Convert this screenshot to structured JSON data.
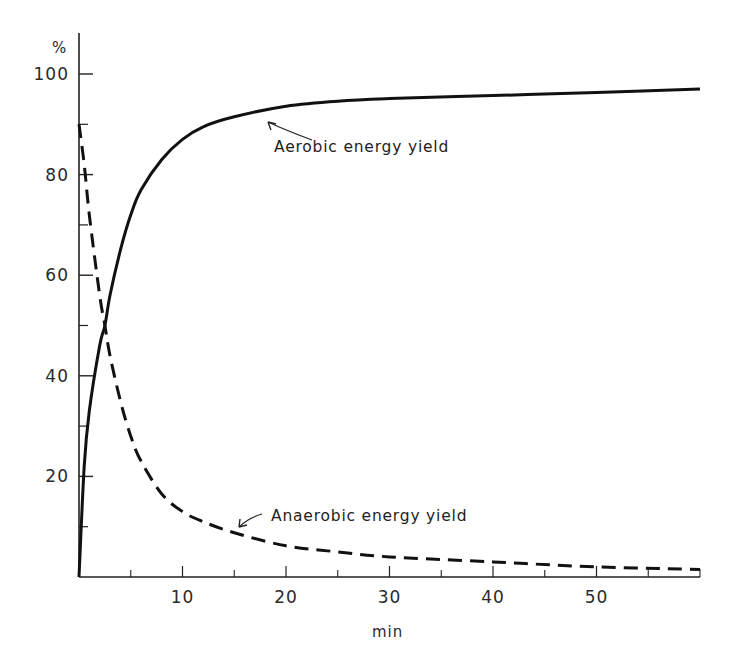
{
  "chart_data": {
    "type": "line",
    "title": "",
    "xlabel": "min",
    "ylabel": "%",
    "xlim": [
      0,
      60
    ],
    "ylim": [
      0,
      100
    ],
    "grid": false,
    "legend": "none (inline annotations with arrows)",
    "x_ticks": [
      10,
      20,
      30,
      40,
      50
    ],
    "x_minor_ticks": [
      5,
      15,
      25,
      35,
      45,
      55
    ],
    "y_ticks": [
      20,
      40,
      60,
      80,
      100
    ],
    "y_minor_ticks": [
      10,
      30,
      50,
      70,
      90
    ],
    "series": [
      {
        "name": "Aerobic energy yield",
        "style": "solid",
        "x": [
          0,
          0.5,
          1,
          2,
          2.5,
          3,
          4,
          5,
          6,
          8,
          10,
          12,
          15,
          20,
          25,
          30,
          40,
          50,
          60
        ],
        "values": [
          0,
          22,
          33,
          46,
          50,
          56,
          65,
          72,
          77,
          83,
          87,
          89.5,
          91.5,
          93.6,
          94.6,
          95.1,
          95.7,
          96.3,
          97
        ]
      },
      {
        "name": "Anaerobic energy yield",
        "style": "dashed",
        "x": [
          0,
          0.5,
          1,
          2,
          2.5,
          3,
          4,
          5,
          6,
          8,
          10,
          12,
          15,
          20,
          25,
          30,
          40,
          50,
          60
        ],
        "values": [
          90,
          82,
          72,
          56,
          50,
          44,
          35,
          28,
          23,
          16.5,
          13,
          11,
          8.8,
          6.2,
          5,
          4,
          3,
          2,
          1.5
        ]
      }
    ],
    "annotations": [
      {
        "text": "Aerobic energy yield",
        "points_to": {
          "x": 15,
          "y": 91.5
        }
      },
      {
        "text": "Anaerobic energy yield",
        "points_to": {
          "x": 15,
          "y": 8.8
        }
      }
    ]
  },
  "labels": {
    "y_unit": "%",
    "x_unit": "min",
    "y_tick_labels": [
      "20",
      "40",
      "60",
      "80",
      "100"
    ],
    "x_tick_labels": [
      "10",
      "20",
      "30",
      "40",
      "50"
    ],
    "aerobic_label": "Aerobic energy yield",
    "anaerobic_label": "Anaerobic energy yield"
  },
  "colors": {
    "ink": "#111111",
    "background": "#ffffff"
  }
}
